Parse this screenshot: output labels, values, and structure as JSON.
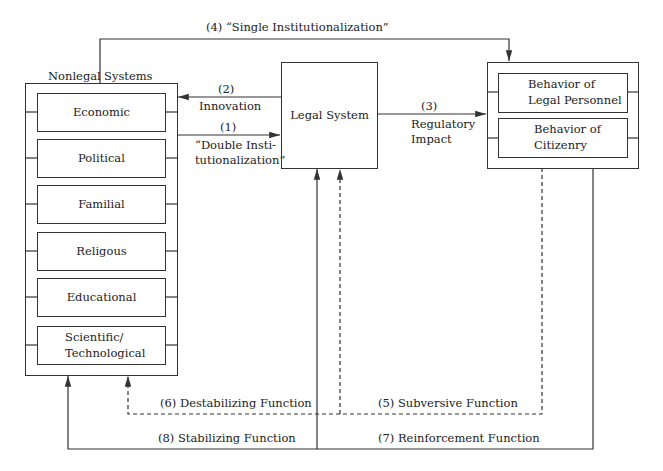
{
  "nonlegal": {
    "title_left": "Nonlegal",
    "title_right": "Systems",
    "items": [
      {
        "label": "Economic"
      },
      {
        "label": "Political"
      },
      {
        "label": "Familial"
      },
      {
        "label": "Religous"
      },
      {
        "label": "Educational"
      },
      {
        "label": "Scientific/\nTechnological"
      }
    ]
  },
  "legal": {
    "label": "Legal System"
  },
  "behavior": {
    "items": [
      {
        "label": "Behavior of\nLegal Personnel"
      },
      {
        "label": "Behavior of\nCitizenry"
      }
    ]
  },
  "arrows": {
    "a1_num": "(1)",
    "a1_text": "“Double Insti-\ntutionalization”",
    "a2_num": "(2)",
    "a2_text": "Innovation",
    "a3_num": "(3)",
    "a3_text": "Regulatory\nImpact",
    "a4": "(4) “Single Institutionalization”",
    "a5": "(5) Subversive Function",
    "a6": "(6) Destabilizing Function",
    "a7": "(7) Reinforcement Function",
    "a8": "(8) Stabilizing Function"
  },
  "colors": {
    "line": "#333333",
    "background": "#ffffff",
    "text": "#222222"
  }
}
